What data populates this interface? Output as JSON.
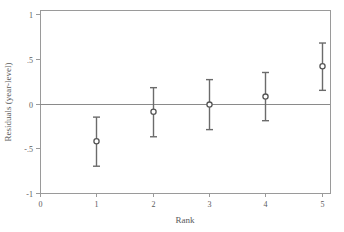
{
  "chart_data": {
    "type": "scatter",
    "title": "",
    "xlabel": "Rank",
    "ylabel": "Residuals (year-level)",
    "x": [
      1,
      2,
      3,
      4,
      5
    ],
    "categories": [
      "1",
      "2",
      "3",
      "4",
      "5"
    ],
    "values": [
      -0.42,
      -0.09,
      -0.01,
      0.08,
      0.42
    ],
    "error_low": [
      -0.7,
      -0.37,
      -0.29,
      -0.19,
      0.15
    ],
    "error_high": [
      -0.15,
      0.18,
      0.27,
      0.35,
      0.68
    ],
    "series": [
      {
        "name": "Residuals (year-level)",
        "values": [
          -0.42,
          -0.09,
          -0.01,
          0.08,
          0.42
        ]
      }
    ],
    "xlim": [
      0,
      5.15
    ],
    "ylim": [
      -1,
      1.05
    ],
    "xticks": [
      0,
      1,
      2,
      3,
      4,
      5
    ],
    "xtick_labels": [
      "0",
      "1",
      "2",
      "3",
      "4",
      "5"
    ],
    "yticks": [
      -1,
      -0.5,
      0,
      0.5,
      1
    ],
    "ytick_labels": [
      "-1",
      "-.5",
      "0",
      ".5",
      "1"
    ],
    "grid": false,
    "legend": "none",
    "reference_line": 0,
    "marker": "open-circle",
    "colors": {
      "marker_stroke": "#555555",
      "marker_fill": "#ffffff",
      "whisker": "#6b6b6b",
      "axis": "#9a9a9a",
      "zero_line": "#8a8a8a",
      "text": "#5a5a5a"
    }
  },
  "axes": {
    "y_title": "Residuals (year-level)",
    "x_title": "Rank",
    "y_ticks": [
      {
        "label": "1",
        "value": 1
      },
      {
        "label": ".5",
        "value": 0.5
      },
      {
        "label": "0",
        "value": 0
      },
      {
        "label": "-.5",
        "value": -0.5
      },
      {
        "label": "-1",
        "value": -1
      }
    ],
    "x_ticks": [
      {
        "label": "0",
        "value": 0
      },
      {
        "label": "1",
        "value": 1
      },
      {
        "label": "2",
        "value": 2
      },
      {
        "label": "3",
        "value": 3
      },
      {
        "label": "4",
        "value": 4
      },
      {
        "label": "5",
        "value": 5
      }
    ]
  },
  "points": [
    {
      "rank": "1",
      "estimate": "-0.42",
      "low": "-0.70",
      "high": "-0.15"
    },
    {
      "rank": "2",
      "estimate": "-0.09",
      "low": "-0.37",
      "high": "0.18"
    },
    {
      "rank": "3",
      "estimate": "-0.01",
      "low": "-0.29",
      "high": "0.27"
    },
    {
      "rank": "4",
      "estimate": "0.08",
      "low": "-0.19",
      "high": "0.35"
    },
    {
      "rank": "5",
      "estimate": "0.42",
      "low": "0.15",
      "high": "0.68"
    }
  ]
}
